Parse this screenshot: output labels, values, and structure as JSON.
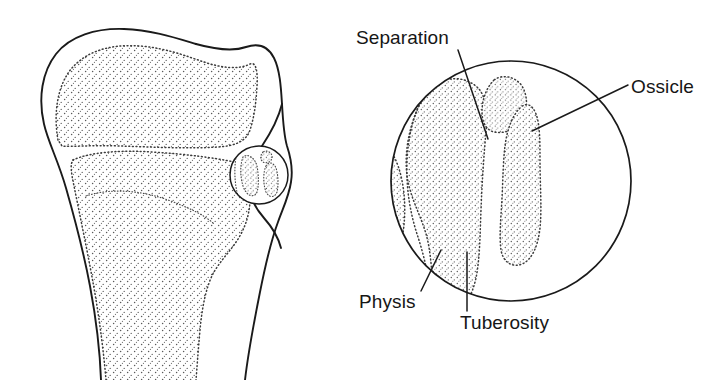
{
  "figure": {
    "background_color": "#ffffff",
    "line_color": "#1a1a1a",
    "stipple_color": "#3c3c3c",
    "panels": [
      {
        "name": "tibia-overview",
        "description": "Lateral view of proximal tibia with epiphysis, metaphysis and tibial tuberosity; small circle marks the detail region"
      },
      {
        "name": "magnified-detail",
        "description": "Circular magnified view of the tibial tuberosity showing an avulsed ossicle separated from the tuberosity"
      }
    ]
  },
  "labels": [
    {
      "id": "separation",
      "text": "Separation",
      "x": 356,
      "y": 28,
      "leader_from": [
        458,
        52
      ],
      "leader_to": [
        487,
        138
      ]
    },
    {
      "id": "ossicle",
      "text": "Ossicle",
      "x": 631,
      "y": 77,
      "leader_from": [
        625,
        85
      ],
      "leader_to": [
        533,
        130
      ]
    },
    {
      "id": "physis",
      "text": "Physis",
      "x": 359,
      "y": 292,
      "leader_from": [
        420,
        289
      ],
      "leader_to": [
        440,
        252
      ]
    },
    {
      "id": "tuberosity",
      "text": "Tuberosity",
      "x": 460,
      "y": 313,
      "leader_from": [
        467,
        310
      ],
      "leader_to": [
        467,
        253
      ]
    }
  ],
  "detail_circle": {
    "center_x": 511,
    "center_y": 181,
    "radius": 121
  },
  "locator_circle": {
    "center_x": 259,
    "center_y": 175,
    "radius": 30
  }
}
